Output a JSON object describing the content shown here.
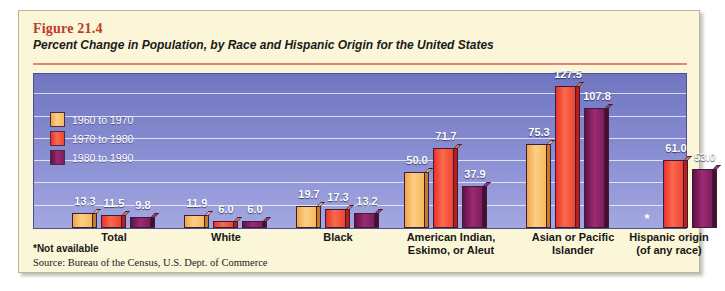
{
  "figure": {
    "number": "Figure 21.4",
    "title": "Percent Change in Population, by Race and Hispanic Origin for the United States",
    "note_not_available": "*Not available",
    "source": "Source: Bureau of the Census, U.S. Dept. of Commerce"
  },
  "colors": {
    "panel_background": "#fbf6d8",
    "plot_background": "#8b90d4",
    "title_rule": "#e8836e",
    "figure_number": "#c0392b",
    "series_1960_1970": "#f6b95f",
    "series_1970_1980": "#ef4430",
    "series_1980_1990": "#7d1d5c",
    "gridline": "#ffffff"
  },
  "chart_data": {
    "type": "bar",
    "title": "Percent Change in Population, by Race and Hispanic Origin for the United States",
    "xlabel": "",
    "ylabel": "",
    "ylim": [
      0,
      140
    ],
    "grid": true,
    "legend_position": "top-left-inside",
    "categories": [
      "Total",
      "White",
      "Black",
      "American Indian, Eskimo, or Aleut",
      "Asian or Pacific Islander",
      "Hispanic origin (of any race)"
    ],
    "category_lines": [
      [
        "Total"
      ],
      [
        "White"
      ],
      [
        "Black"
      ],
      [
        "American Indian,",
        "Eskimo, or Aleut"
      ],
      [
        "Asian or Pacific",
        "Islander"
      ],
      [
        "Hispanic origin",
        "(of any race)"
      ]
    ],
    "series": [
      {
        "name": "1960 to 1970",
        "values": [
          13.3,
          11.9,
          19.7,
          50.0,
          75.3,
          null
        ],
        "labels": [
          "13.3",
          "11.9",
          "19.7",
          "50.0",
          "75.3",
          "*"
        ]
      },
      {
        "name": "1970 to 1980",
        "values": [
          11.5,
          6.0,
          17.3,
          71.7,
          127.5,
          61.0
        ],
        "labels": [
          "11.5",
          "6.0",
          "17.3",
          "71.7",
          "127.5",
          "61.0"
        ]
      },
      {
        "name": "1980 to 1990",
        "values": [
          9.8,
          6.0,
          13.2,
          37.9,
          107.8,
          53.0
        ],
        "labels": [
          "9.8",
          "6.0",
          "13.2",
          "37.9",
          "107.8",
          "53.0"
        ]
      }
    ],
    "annotations": [
      "*Not available"
    ]
  }
}
